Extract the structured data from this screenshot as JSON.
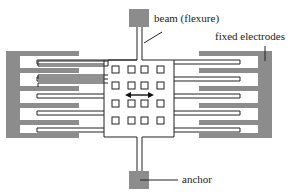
{
  "diagram": {
    "type": "MEMS comb-drive actuator schematic",
    "labels": {
      "beam": "beam (flexure)",
      "fixed_electrodes": "fixed electrodes",
      "anchor": "anchor"
    },
    "colors": {
      "fixed_electrode": "#8c8c8c",
      "anchor": "#8c8c8c",
      "outline": "#222222",
      "background": "#ffffff"
    },
    "arrow": "double-headed horizontal arrow indicating motion direction"
  }
}
